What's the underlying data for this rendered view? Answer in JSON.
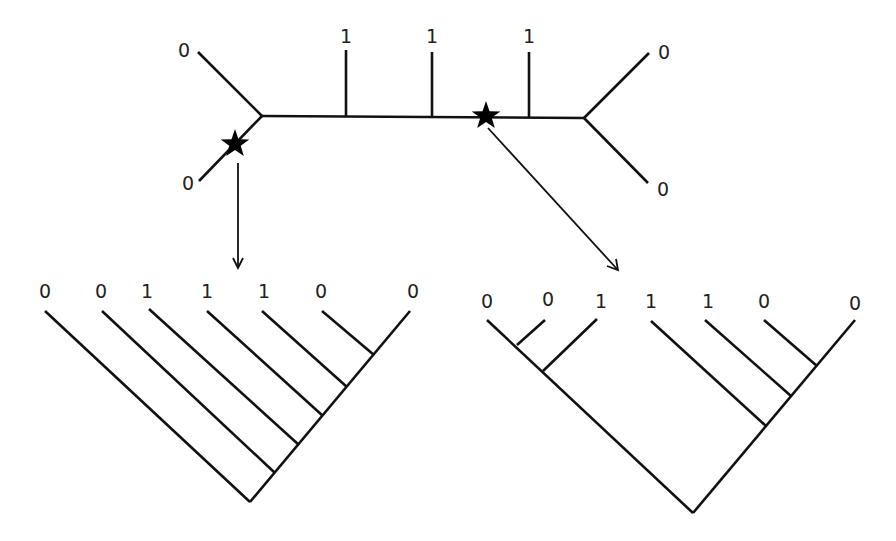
{
  "diagram": {
    "type": "phylogenetic-trees",
    "colors": {
      "line": "#111111",
      "text": "#222222",
      "background": "#ffffff",
      "star": "#000000"
    },
    "unrooted_tree": {
      "leaf_labels": {
        "top_left": "0",
        "bottom_left": "0",
        "mid_1": "1",
        "mid_2": "1",
        "mid_3": "1",
        "top_right": "0",
        "bottom_right": "0"
      },
      "root_markers": [
        {
          "name": "star-left",
          "position": "branch to bottom-left leaf"
        },
        {
          "name": "star-right",
          "position": "internal branch between 2nd and 3rd '1'"
        }
      ]
    },
    "rooted_tree_left": {
      "leaf_labels": [
        "0",
        "0",
        "1",
        "1",
        "1",
        "0",
        "0"
      ],
      "topology": "pectinate (ladder) tree rooted at left star"
    },
    "rooted_tree_right": {
      "leaf_labels": [
        "0",
        "0",
        "1",
        "1",
        "1",
        "0",
        "0"
      ],
      "topology": "two ladder clades rooted at right star"
    }
  }
}
